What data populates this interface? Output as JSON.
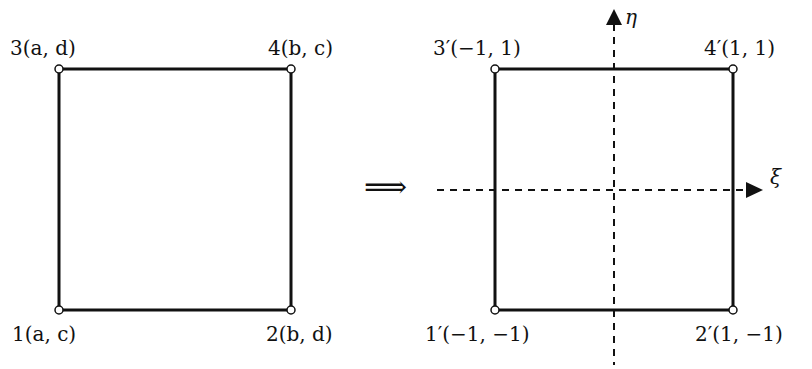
{
  "diagram": {
    "left_square": {
      "nodes": [
        {
          "id": "1",
          "label": "1(a, c)"
        },
        {
          "id": "2",
          "label": "2(b, d)"
        },
        {
          "id": "3",
          "label": "3(a, d)"
        },
        {
          "id": "4",
          "label": "4(b, c)"
        }
      ]
    },
    "mapping_arrow": "⟹",
    "right_square": {
      "nodes": [
        {
          "id": "1'",
          "label": "1′(−1, −1)"
        },
        {
          "id": "2'",
          "label": "2′(1, −1)"
        },
        {
          "id": "3'",
          "label": "3′(−1, 1)"
        },
        {
          "id": "4'",
          "label": "4′(1, 1)"
        }
      ],
      "axes": {
        "horizontal": "ξ",
        "vertical": "η"
      }
    }
  }
}
